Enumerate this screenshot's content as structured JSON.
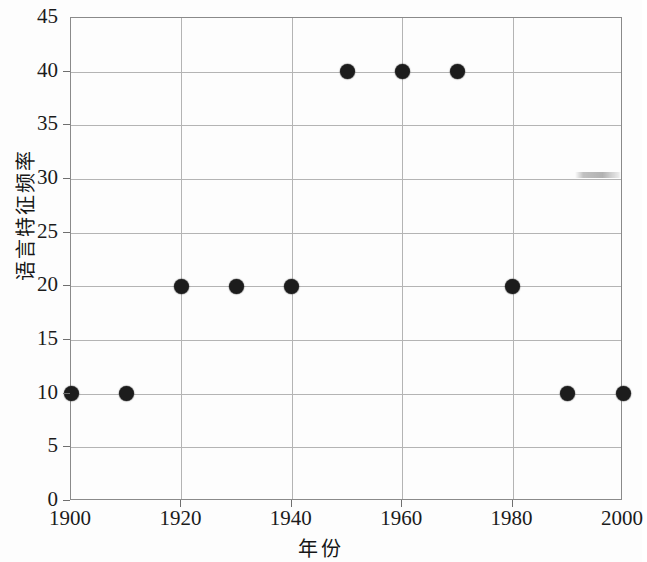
{
  "chart_data": {
    "type": "scatter",
    "title": "",
    "xlabel": "年份",
    "ylabel": "语言特征频率",
    "x": [
      1900,
      1910,
      1920,
      1930,
      1940,
      1950,
      1960,
      1970,
      1980,
      1990,
      2000
    ],
    "values": [
      10,
      10,
      20,
      20,
      20,
      40,
      40,
      40,
      20,
      10,
      10
    ],
    "series": [
      {
        "name": "语言特征频率",
        "points": [
          {
            "x": 1900,
            "y": 10
          },
          {
            "x": 1910,
            "y": 10
          },
          {
            "x": 1920,
            "y": 20
          },
          {
            "x": 1930,
            "y": 20
          },
          {
            "x": 1940,
            "y": 20
          },
          {
            "x": 1950,
            "y": 40
          },
          {
            "x": 1960,
            "y": 40
          },
          {
            "x": 1970,
            "y": 40
          },
          {
            "x": 1980,
            "y": 20
          },
          {
            "x": 1990,
            "y": 10
          },
          {
            "x": 2000,
            "y": 10
          }
        ]
      }
    ],
    "xlim": [
      1900,
      2000
    ],
    "ylim": [
      0,
      45
    ],
    "xticks": [
      1900,
      1920,
      1940,
      1960,
      1980,
      2000
    ],
    "xtick_labels": [
      "1900",
      "1920",
      "1940",
      "1960",
      "1980",
      "2000"
    ],
    "yticks": [
      0,
      5,
      10,
      15,
      20,
      25,
      30,
      35,
      40,
      45
    ],
    "ytick_labels": [
      "0",
      "5",
      "10",
      "15",
      "20",
      "25",
      "30",
      "35",
      "40",
      "45"
    ],
    "grid": true,
    "grid_axis": "both",
    "legend": false,
    "legend_position": "none",
    "marker": "filled-circle",
    "marker_color": "#1c1c1c",
    "gridline_color": "#b4b4b4",
    "axis_color": "#8a8a8a",
    "background_color": "#fdfdfd",
    "text_color": "#1b1b1b",
    "annotations": []
  }
}
